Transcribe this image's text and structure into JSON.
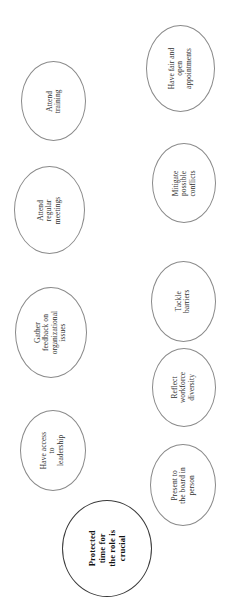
{
  "diagram": {
    "type": "cluster-bubble-diagram",
    "orientation": "rotated-90-ccw",
    "background_color": "#ffffff",
    "node_fill_color": "#ffffff",
    "node_stroke_color": "#8a8a8a",
    "central_node_stroke_color": "#3a3a3a",
    "text_color": "#2f2f2f",
    "central": {
      "label": "Protected time for the role is crucial",
      "lines": [
        "Protected",
        "time for",
        "the role is",
        "crucial"
      ]
    },
    "nodes": [
      {
        "label": "Attend training",
        "lines": [
          "Attend",
          "training"
        ]
      },
      {
        "label": "Attend regular meetings",
        "lines": [
          "Attend",
          "regular",
          "meetings"
        ]
      },
      {
        "label": "Gather feedback on organizational issues",
        "lines": [
          "Gather",
          "feedback on",
          "organizational",
          "issues"
        ]
      },
      {
        "label": "Have access to leadership",
        "lines": [
          "Have access",
          "to",
          "leadership"
        ]
      },
      {
        "label": "Have fair and open appointments",
        "lines": [
          "Have fair and",
          "open",
          "appointments"
        ]
      },
      {
        "label": "Mitigate possible conflicts",
        "lines": [
          "Mitigate",
          "possible",
          "conflicts"
        ]
      },
      {
        "label": "Tackle barriers",
        "lines": [
          "Tackle",
          "barriers"
        ]
      },
      {
        "label": "Reflect workforce diversity",
        "lines": [
          "Reflect",
          "workforce",
          "diversity"
        ]
      },
      {
        "label": "Present to the board in person",
        "lines": [
          "Present to",
          "the board in",
          "person"
        ]
      }
    ]
  }
}
